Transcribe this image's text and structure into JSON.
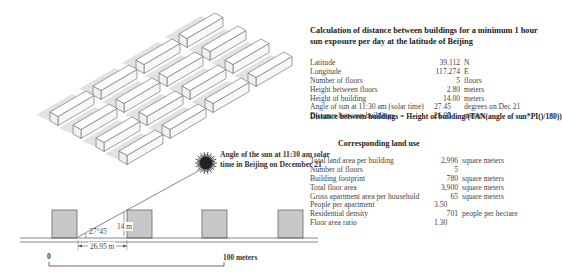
{
  "title": "Calculation of distance between buildings for a minimum 1 hour sun exposure per day at the latitude of Beijing",
  "calculation": [
    {
      "label": "Latitude",
      "value": "39.112",
      "unit": "N"
    },
    {
      "label": "Longitude",
      "value": "117.274",
      "unit": "E"
    },
    {
      "label": "Number of floors",
      "value": "5",
      "unit": "floors"
    },
    {
      "label": "Height between floors",
      "value": "2.80",
      "unit": "meters"
    },
    {
      "label": "Height of building",
      "value": "14.00",
      "unit": "meters"
    },
    {
      "label": "Angle of sun at 11:30 am (solar time)",
      "value": "27.45",
      "unit": "degrees on Dec 21"
    },
    {
      "label": "Distance between buildings",
      "value": "26.95",
      "unit": "meters"
    }
  ],
  "formula": "Distance between buildings  = Height of building/(TAN(angle of sun*PI()/180))",
  "land_use": {
    "title": "Corresponding land use",
    "rows": [
      {
        "label": "Total land area per building",
        "value": "2,996",
        "unit": "square meters"
      },
      {
        "label": "Number of floors",
        "value": "5",
        "unit": ""
      },
      {
        "label": "Building footprint",
        "value": "780",
        "unit": "square meters"
      },
      {
        "label": "Total floor area",
        "value": "3,900",
        "unit": "square meters"
      },
      {
        "label": "Gross apartment area per household",
        "value": "65",
        "unit": "square meters"
      },
      {
        "label": "People per apartment",
        "value": "3.50",
        "unit": ""
      },
      {
        "label": "Residential density",
        "value": "701",
        "unit": "people per hectare"
      },
      {
        "label": "Floor area ratio",
        "value": "1.30",
        "unit": ""
      }
    ]
  },
  "sun_label": "Angle of the sun at 11:30 am solar time in Beijing on December 21",
  "section": {
    "height_label": "14 m",
    "angle_label": "27°45",
    "distance_label": "26.95 m"
  },
  "scale_bar": {
    "start": "0",
    "end": "100 meters"
  },
  "colors": {
    "building_fill": "#c8c8c8",
    "building_stroke": "#555555",
    "shadow": "#e2e2e2",
    "iso_block_fill": "#ffffff",
    "iso_block_stroke": "#777777"
  }
}
